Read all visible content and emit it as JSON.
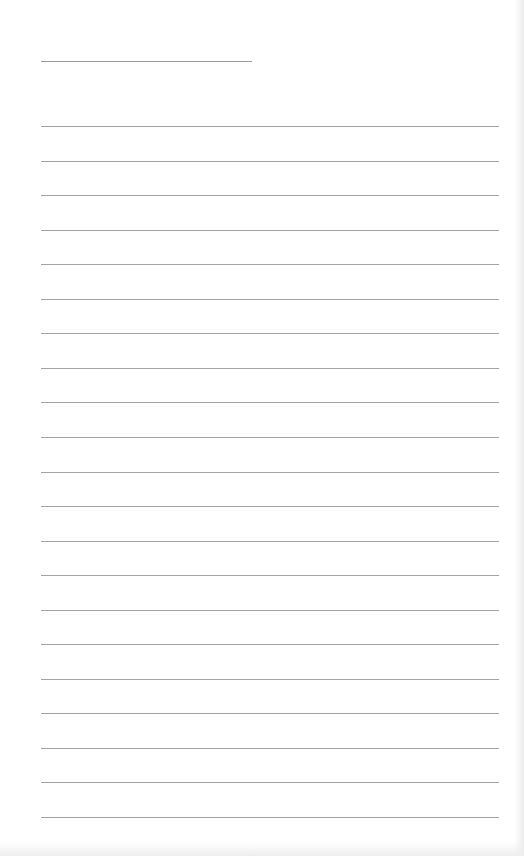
{
  "document": {
    "type": "blank lined paper",
    "title_line": {
      "text": ""
    },
    "rule_color": "#a3a3a3",
    "lines": [
      {
        "text": ""
      },
      {
        "text": ""
      },
      {
        "text": ""
      },
      {
        "text": ""
      },
      {
        "text": ""
      },
      {
        "text": ""
      },
      {
        "text": ""
      },
      {
        "text": ""
      },
      {
        "text": ""
      },
      {
        "text": ""
      },
      {
        "text": ""
      },
      {
        "text": ""
      },
      {
        "text": ""
      },
      {
        "text": ""
      },
      {
        "text": ""
      },
      {
        "text": ""
      },
      {
        "text": ""
      },
      {
        "text": ""
      },
      {
        "text": ""
      },
      {
        "text": ""
      },
      {
        "text": ""
      }
    ]
  }
}
